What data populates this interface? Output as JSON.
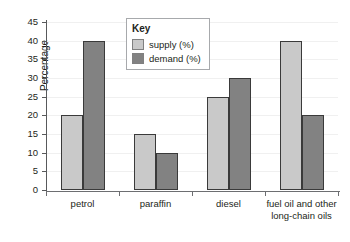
{
  "chart_data": {
    "type": "bar",
    "title": "",
    "xlabel": "",
    "ylabel": "Percentage",
    "ylim": [
      0,
      45
    ],
    "ytick_step": 5,
    "yticks": [
      "0",
      "5",
      "10",
      "15",
      "20",
      "25",
      "30",
      "35",
      "40",
      "45"
    ],
    "grid": true,
    "legend_position": "top-center",
    "legend_title": "Key",
    "categories": [
      "petrol",
      "paraffin",
      "diesel",
      "fuel oil and other long-chain oils"
    ],
    "series": [
      {
        "name": "supply (%)",
        "color": "#c9c9c9",
        "values": [
          20,
          15,
          25,
          40
        ]
      },
      {
        "name": "demand (%)",
        "color": "#828282",
        "values": [
          40,
          10,
          30,
          20
        ]
      }
    ]
  },
  "axis": {
    "y_title": "Percentage"
  }
}
